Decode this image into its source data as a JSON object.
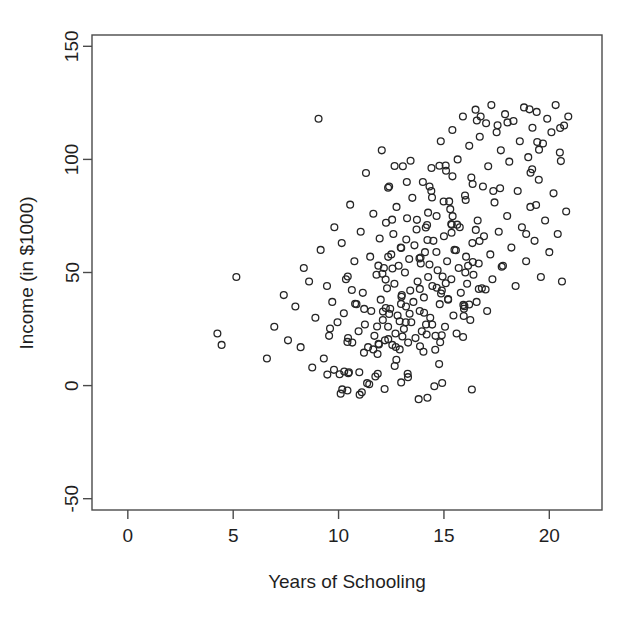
{
  "chart_data": {
    "type": "scatter",
    "title": "",
    "xlabel": "Years of Schooling",
    "ylabel": "Income (in $1000)",
    "xlim": [
      -1.7,
      22.5
    ],
    "ylim": [
      -55,
      155
    ],
    "xticks": [
      0,
      5,
      10,
      15,
      20
    ],
    "xtick_labels": [
      "0",
      "5",
      "10",
      "15",
      "20"
    ],
    "yticks": [
      -50,
      0,
      50,
      100,
      150
    ],
    "ytick_labels": [
      "-50",
      "0",
      "50",
      "100",
      "150"
    ],
    "grid": false,
    "legend": null,
    "marker": {
      "shape": "open-circle",
      "radius": 3.4,
      "stroke": "#262626",
      "stroke_width": 1.3,
      "fill": "none"
    },
    "axis_color": "#4a4a4a",
    "background": "#ffffff",
    "n_points": 300,
    "points": [
      [
        4.25,
        23
      ],
      [
        4.45,
        18
      ],
      [
        5.15,
        48
      ],
      [
        6.6,
        12
      ],
      [
        6.95,
        26
      ],
      [
        7.4,
        40
      ],
      [
        7.6,
        20
      ],
      [
        7.95,
        35
      ],
      [
        8.2,
        17
      ],
      [
        8.35,
        52
      ],
      [
        8.6,
        46
      ],
      [
        8.75,
        8
      ],
      [
        8.9,
        30
      ],
      [
        9.05,
        118
      ],
      [
        9.15,
        60
      ],
      [
        9.3,
        12
      ],
      [
        9.45,
        44
      ],
      [
        9.55,
        22
      ],
      [
        9.7,
        37
      ],
      [
        9.8,
        70
      ],
      [
        9.95,
        28
      ],
      [
        10.05,
        5
      ],
      [
        10.15,
        63
      ],
      [
        10.25,
        32
      ],
      [
        10.35,
        47
      ],
      [
        10.45,
        21
      ],
      [
        10.55,
        80
      ],
      [
        10.65,
        19
      ],
      [
        10.75,
        55
      ],
      [
        10.85,
        36
      ],
      [
        10.95,
        24
      ],
      [
        11.0,
        -4
      ],
      [
        11.05,
        68
      ],
      [
        11.15,
        41
      ],
      [
        11.25,
        27
      ],
      [
        11.3,
        94
      ],
      [
        11.4,
        17
      ],
      [
        11.5,
        57
      ],
      [
        11.55,
        33
      ],
      [
        11.65,
        76
      ],
      [
        11.7,
        22
      ],
      [
        11.8,
        49
      ],
      [
        11.85,
        14
      ],
      [
        11.95,
        65
      ],
      [
        12.0,
        38
      ],
      [
        12.05,
        104
      ],
      [
        12.1,
        29
      ],
      [
        12.15,
        52
      ],
      [
        12.2,
        20
      ],
      [
        12.25,
        72
      ],
      [
        12.3,
        43
      ],
      [
        12.35,
        26
      ],
      [
        12.4,
        88
      ],
      [
        12.45,
        34
      ],
      [
        12.5,
        58
      ],
      [
        12.55,
        18
      ],
      [
        12.6,
        67
      ],
      [
        12.65,
        45
      ],
      [
        12.7,
        23
      ],
      [
        12.75,
        79
      ],
      [
        12.8,
        31
      ],
      [
        12.85,
        53
      ],
      [
        12.9,
        16
      ],
      [
        12.95,
        61
      ],
      [
        13.0,
        40
      ],
      [
        13.05,
        97
      ],
      [
        13.1,
        25
      ],
      [
        13.15,
        50
      ],
      [
        13.2,
        35
      ],
      [
        13.25,
        74
      ],
      [
        13.3,
        19
      ],
      [
        13.35,
        56
      ],
      [
        13.4,
        42
      ],
      [
        13.45,
        28
      ],
      [
        13.5,
        83
      ],
      [
        13.55,
        37
      ],
      [
        13.6,
        62
      ],
      [
        13.65,
        21
      ],
      [
        13.7,
        69
      ],
      [
        13.75,
        46
      ],
      [
        13.8,
        -6
      ],
      [
        13.85,
        33
      ],
      [
        13.9,
        54
      ],
      [
        13.95,
        24
      ],
      [
        14.0,
        90
      ],
      [
        14.05,
        39
      ],
      [
        14.1,
        59
      ],
      [
        14.15,
        27
      ],
      [
        14.2,
        71
      ],
      [
        14.25,
        48
      ],
      [
        14.35,
        30
      ],
      [
        14.4,
        86
      ],
      [
        14.45,
        44
      ],
      [
        14.5,
        64
      ],
      [
        14.6,
        22
      ],
      [
        14.65,
        75
      ],
      [
        14.7,
        51
      ],
      [
        14.8,
        36
      ],
      [
        14.85,
        108
      ],
      [
        14.9,
        42
      ],
      [
        15.0,
        66
      ],
      [
        15.05,
        26
      ],
      [
        15.1,
        95
      ],
      [
        15.15,
        55
      ],
      [
        15.2,
        38
      ],
      [
        15.3,
        78
      ],
      [
        15.35,
        47
      ],
      [
        15.4,
        113
      ],
      [
        15.45,
        31
      ],
      [
        15.5,
        60
      ],
      [
        15.6,
        23
      ],
      [
        15.65,
        100
      ],
      [
        15.7,
        52
      ],
      [
        15.75,
        70
      ],
      [
        15.8,
        41
      ],
      [
        15.9,
        119
      ],
      [
        15.95,
        34
      ],
      [
        16.0,
        84
      ],
      [
        16.05,
        57
      ],
      [
        16.1,
        45
      ],
      [
        16.2,
        106
      ],
      [
        16.25,
        29
      ],
      [
        16.3,
        92
      ],
      [
        16.35,
        63
      ],
      [
        16.4,
        49
      ],
      [
        16.5,
        122
      ],
      [
        16.55,
        37
      ],
      [
        16.6,
        73
      ],
      [
        16.65,
        54
      ],
      [
        16.7,
        110
      ],
      [
        16.8,
        43
      ],
      [
        16.85,
        88
      ],
      [
        16.9,
        66
      ],
      [
        17.0,
        116
      ],
      [
        17.05,
        33
      ],
      [
        17.1,
        97
      ],
      [
        17.2,
        58
      ],
      [
        17.25,
        124
      ],
      [
        17.3,
        47
      ],
      [
        17.4,
        81
      ],
      [
        17.5,
        112
      ],
      [
        17.6,
        68
      ],
      [
        17.7,
        104
      ],
      [
        17.8,
        53
      ],
      [
        17.9,
        120
      ],
      [
        18.0,
        75
      ],
      [
        18.1,
        99
      ],
      [
        18.2,
        61
      ],
      [
        18.3,
        117
      ],
      [
        18.4,
        44
      ],
      [
        18.5,
        86
      ],
      [
        18.6,
        108
      ],
      [
        18.7,
        70
      ],
      [
        18.8,
        123
      ],
      [
        18.9,
        55
      ],
      [
        19.0,
        101
      ],
      [
        19.1,
        79
      ],
      [
        19.2,
        114
      ],
      [
        19.3,
        64
      ],
      [
        19.4,
        121
      ],
      [
        19.5,
        91
      ],
      [
        19.6,
        48
      ],
      [
        19.7,
        107
      ],
      [
        19.8,
        73
      ],
      [
        19.9,
        118
      ],
      [
        20.0,
        59
      ],
      [
        20.1,
        112
      ],
      [
        20.2,
        85
      ],
      [
        20.3,
        124
      ],
      [
        20.4,
        67
      ],
      [
        20.5,
        103
      ],
      [
        20.6,
        46
      ],
      [
        20.7,
        115
      ],
      [
        20.8,
        77
      ],
      [
        20.9,
        119
      ]
    ]
  }
}
